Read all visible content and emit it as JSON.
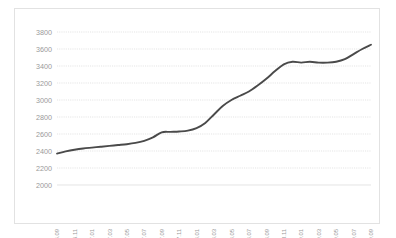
{
  "chart_data": {
    "type": "line",
    "title": "",
    "subtitle": "",
    "xlabel": "",
    "ylabel": "",
    "ylim": [
      2000,
      3800
    ],
    "ytick_step": 200,
    "yticks": [
      2000,
      2200,
      2400,
      2600,
      2800,
      3000,
      3200,
      3400,
      3600,
      3800
    ],
    "ytick_labels": [
      "2000",
      "2200",
      "2400",
      "2600",
      "2800",
      "3000",
      "3200",
      "3400",
      "3600",
      "3800"
    ],
    "grid": true,
    "grid_style": "dotted-horizontal",
    "legend": false,
    "legend_position": "none",
    "xtick_rotation": -90,
    "xtick_labels": [
      "2016.09",
      "2016.11",
      "2017.01",
      "2017.03",
      "2017.05",
      "2017.07",
      "2017.09",
      "2017.11",
      "2018.01",
      "2018.03",
      "2018.05",
      "2018.07",
      "2018.09",
      "2018.11",
      "2019.01",
      "2019.03",
      "2019.05",
      "2019.07",
      "2019.09"
    ],
    "x": [
      "2016.09",
      "2016.10",
      "2016.11",
      "2016.12",
      "2017.01",
      "2017.02",
      "2017.03",
      "2017.04",
      "2017.05",
      "2017.06",
      "2017.07",
      "2017.08",
      "2017.09",
      "2017.10",
      "2017.11",
      "2017.12",
      "2018.01",
      "2018.02",
      "2018.03",
      "2018.04",
      "2018.05",
      "2018.06",
      "2018.07",
      "2018.08",
      "2018.09",
      "2018.10",
      "2018.11",
      "2018.12",
      "2019.01",
      "2019.02",
      "2019.03",
      "2019.04",
      "2019.05",
      "2019.06",
      "2019.07",
      "2019.08",
      "2019.09"
    ],
    "values": [
      2370,
      2395,
      2415,
      2430,
      2440,
      2450,
      2460,
      2470,
      2480,
      2495,
      2520,
      2560,
      2620,
      2625,
      2630,
      2640,
      2670,
      2730,
      2830,
      2930,
      3000,
      3050,
      3100,
      3170,
      3250,
      3340,
      3420,
      3450,
      3440,
      3450,
      3440,
      3440,
      3450,
      3480,
      3540,
      3600,
      3650
    ],
    "series": [
      {
        "name": "value",
        "color": "#4a4a4a",
        "values": [
          2370,
          2395,
          2415,
          2430,
          2440,
          2450,
          2460,
          2470,
          2480,
          2495,
          2520,
          2560,
          2620,
          2625,
          2630,
          2640,
          2670,
          2730,
          2830,
          2930,
          3000,
          3050,
          3100,
          3170,
          3250,
          3340,
          3420,
          3450,
          3440,
          3450,
          3440,
          3440,
          3450,
          3480,
          3540,
          3600,
          3650
        ]
      }
    ]
  },
  "colors": {
    "line": "#4a4a4a",
    "grid": "#d9d9d9",
    "tick_text": "#9a9a9a",
    "frame_border": "#e2e2e2",
    "background": "#ffffff"
  }
}
